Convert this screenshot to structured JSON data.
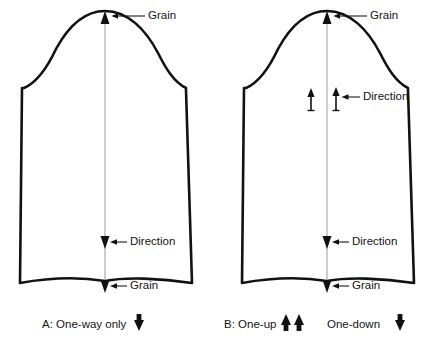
{
  "figure": {
    "background_color": "#ffffff",
    "outline_color": "#111111",
    "grain_line_color": "#9a9a9a"
  },
  "panels": [
    {
      "id": "panel-a",
      "caption_label": "A: One-way only",
      "caption_arrows": [
        "down"
      ],
      "annotations": [
        {
          "name": "grain-top",
          "label": "Grain",
          "arrow_direction": "up"
        },
        {
          "name": "direction-bottom",
          "label": "Direction",
          "arrow_direction": "down"
        },
        {
          "name": "grain-bottom",
          "label": "Grain",
          "arrow_direction": "down"
        }
      ]
    },
    {
      "id": "panel-b",
      "caption_label": "B: One-up",
      "caption_label_secondary": "One-down",
      "caption_arrows": [
        "up",
        "up"
      ],
      "caption_arrows_secondary": [
        "down"
      ],
      "annotations": [
        {
          "name": "grain-top",
          "label": "Grain",
          "arrow_direction": "up"
        },
        {
          "name": "direction-middle",
          "label": "Direction",
          "arrow_direction": "up"
        },
        {
          "name": "direction-bottom",
          "label": "Direction",
          "arrow_direction": "down"
        },
        {
          "name": "grain-bottom",
          "label": "Grain",
          "arrow_direction": "down"
        }
      ]
    }
  ],
  "labels": {
    "grain": "Grain",
    "direction": "Direction",
    "caption_a": "A: One-way only",
    "caption_b": "B: One-up",
    "caption_b_secondary": "One-down"
  }
}
